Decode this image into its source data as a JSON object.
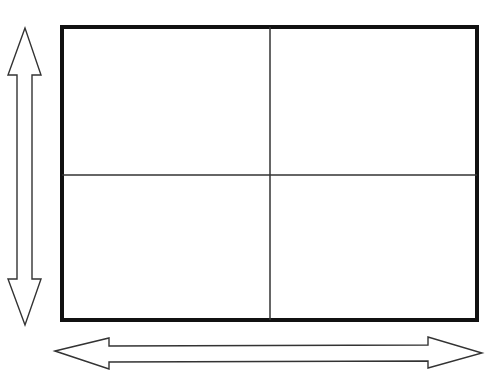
{
  "title": "",
  "diagram": {
    "outer_frame": {
      "x": 62,
      "y": 27,
      "width": 415,
      "height": 293,
      "stroke": "#111111",
      "stroke_width": 4
    },
    "grid": {
      "rows": 2,
      "cols": 2,
      "divider_x": 270,
      "divider_y": 175,
      "stroke": "#333333",
      "stroke_width": 1.5
    },
    "vertical_arrow": {
      "direction": "double-headed vertical",
      "x_center": 25,
      "y_top": 28,
      "y_bottom": 325
    },
    "horizontal_arrow": {
      "direction": "double-headed horizontal",
      "y_center": 351,
      "x_left": 55,
      "x_right": 482
    },
    "line_color": "#333333",
    "background": "#ffffff"
  }
}
